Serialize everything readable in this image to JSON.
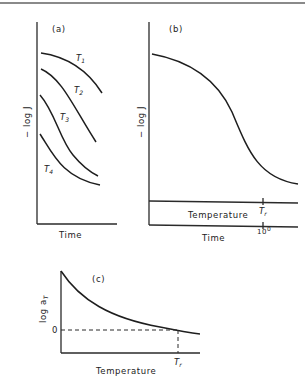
{
  "figure": {
    "panels": [
      {
        "id": "a",
        "label": "(a)",
        "ylabel": "− log J",
        "xlabel": "Time",
        "curves": [
          {
            "name": "T1",
            "label": "T",
            "subscript": "1"
          },
          {
            "name": "T2",
            "label": "T",
            "subscript": "2"
          },
          {
            "name": "T3",
            "label": "T",
            "subscript": "3"
          },
          {
            "name": "T4",
            "label": "T",
            "subscript": "4"
          }
        ]
      },
      {
        "id": "b",
        "label": "(b)",
        "ylabel": "− log J",
        "xlabel": "Time",
        "secondary_axis_label": "Temperature",
        "ref_temp_label": "T",
        "ref_temp_subscript": "r",
        "time_tick_label": "10",
        "time_tick_superscript": "0"
      },
      {
        "id": "c",
        "label": "(c)",
        "ylabel": "log a",
        "ylabel_subscript": "T",
        "xlabel": "Temperature",
        "zero_label": "0",
        "ref_temp_label": "T",
        "ref_temp_subscript": "r"
      }
    ]
  }
}
